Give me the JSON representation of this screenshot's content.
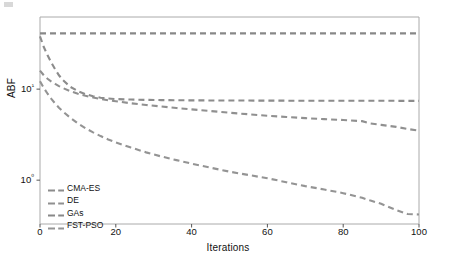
{
  "chart_data": {
    "type": "line",
    "title": "",
    "subtitle": "",
    "xlabel": "Iterations",
    "ylabel": "ABF",
    "yscale": "log",
    "xscale": "linear",
    "xlim": [
      0,
      100
    ],
    "ylim": [
      0.33,
      62
    ],
    "grid": false,
    "legend_position": "lower-left-inside",
    "xticks": [
      "0",
      "20",
      "40",
      "60",
      "80",
      "100"
    ],
    "xtick_values": [
      0,
      20,
      40,
      60,
      80,
      100
    ],
    "yticks": [
      "10¹",
      "10⁰"
    ],
    "ytick_values": [
      10,
      1
    ],
    "x": [
      0,
      1,
      2,
      3,
      4,
      5,
      6,
      8,
      10,
      12,
      14,
      16,
      18,
      20,
      24,
      28,
      32,
      36,
      40,
      45,
      50,
      55,
      60,
      65,
      70,
      75,
      80,
      85,
      87,
      90,
      94,
      97,
      100
    ],
    "series": [
      {
        "name": "CMA-ES",
        "color": "#8c8c8c",
        "linestyle": "dashed",
        "values": [
          38.0,
          29.0,
          23.5,
          19.5,
          16.5,
          14.2,
          12.6,
          10.6,
          9.5,
          8.8,
          8.35,
          8.05,
          7.88,
          7.78,
          7.68,
          7.62,
          7.58,
          7.55,
          7.53,
          7.51,
          7.5,
          7.49,
          7.48,
          7.47,
          7.46,
          7.46,
          7.45,
          7.45,
          7.45,
          7.45,
          7.44,
          7.44,
          7.44
        ]
      },
      {
        "name": "DE",
        "color": "#909090",
        "linestyle": "dashed",
        "values": [
          16.0,
          14.2,
          13.0,
          12.1,
          11.4,
          10.8,
          10.3,
          9.5,
          8.9,
          8.45,
          8.1,
          7.8,
          7.55,
          7.35,
          7.0,
          6.7,
          6.45,
          6.2,
          6.0,
          5.75,
          5.5,
          5.3,
          5.1,
          4.95,
          4.8,
          4.68,
          4.58,
          4.45,
          4.2,
          4.05,
          3.85,
          3.65,
          3.5
        ]
      },
      {
        "name": "GAs",
        "color": "#888888",
        "linestyle": "dashed",
        "values": [
          41.0,
          41.0,
          41.0,
          41.0,
          41.0,
          41.0,
          41.0,
          41.0,
          41.0,
          41.0,
          41.0,
          41.0,
          41.0,
          41.0,
          41.0,
          41.0,
          41.0,
          41.0,
          41.0,
          41.0,
          41.0,
          41.0,
          41.0,
          41.0,
          41.0,
          41.0,
          41.0,
          41.0,
          41.0,
          41.0,
          41.0,
          41.0,
          41.0
        ]
      },
      {
        "name": "FST-PSO",
        "color": "#949494",
        "linestyle": "dashed",
        "values": [
          12.2,
          10.3,
          8.9,
          7.8,
          6.95,
          6.25,
          5.7,
          4.85,
          4.2,
          3.72,
          3.35,
          3.05,
          2.8,
          2.6,
          2.28,
          2.02,
          1.82,
          1.66,
          1.52,
          1.37,
          1.24,
          1.14,
          1.05,
          0.95,
          0.86,
          0.79,
          0.72,
          0.64,
          0.6,
          0.55,
          0.47,
          0.425,
          0.42
        ]
      }
    ]
  },
  "legend": {
    "entries": [
      {
        "label": "CMA-ES"
      },
      {
        "label": "DE"
      },
      {
        "label": "GAs"
      },
      {
        "label": "FST-PSO"
      }
    ]
  },
  "axes": {
    "frame_color": "#aaaaaa"
  }
}
